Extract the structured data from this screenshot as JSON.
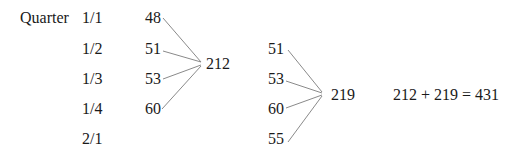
{
  "header": {
    "label": "Quarter"
  },
  "quarters": [
    "1/1",
    "1/2",
    "1/3",
    "1/4",
    "2/1"
  ],
  "group1": {
    "values": [
      "48",
      "51",
      "53",
      "60"
    ],
    "sum": "212"
  },
  "group2": {
    "values": [
      "51",
      "53",
      "60",
      "55"
    ],
    "sum": "219"
  },
  "equation": "212 + 219 = 431",
  "colors": {
    "text": "#1a1a1a",
    "connector": "#8a8a8a"
  }
}
